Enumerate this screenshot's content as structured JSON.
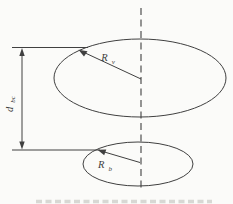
{
  "figure": {
    "labels": {
      "top_radius": {
        "base": "R",
        "sub": "v"
      },
      "bottom_radius": {
        "base": "R",
        "sub": "b"
      },
      "separation": {
        "base": "d",
        "sub": "bc"
      }
    }
  },
  "colors": {
    "ink": "#404040",
    "paper": "#fbfbf9",
    "caption_ink": "#bdbdb6"
  }
}
